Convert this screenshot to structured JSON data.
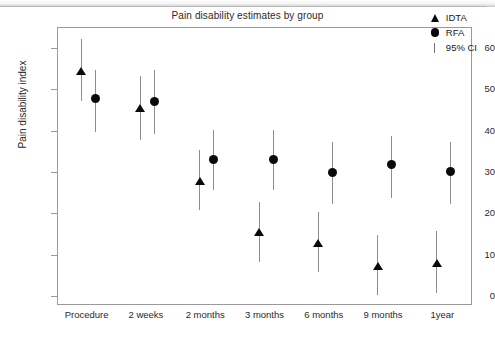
{
  "chart_data": {
    "type": "scatter",
    "title": "Pain disability estimates by group",
    "xlabel": "",
    "ylabel": "Pain disability index",
    "categories": [
      "Procedure",
      "2 weeks",
      "2 months",
      "3 months",
      "6 months",
      "9 months",
      "1year"
    ],
    "ylim": [
      0,
      64
    ],
    "yticks": [
      0,
      10,
      20,
      30,
      40,
      50,
      60
    ],
    "ytick_labels": [
      "0",
      "10",
      "20",
      "30",
      "40",
      "50",
      "60"
    ],
    "grid": false,
    "legend_position": "top-right",
    "legend": [
      {
        "label": "IDTA",
        "marker": "triangle",
        "color": "#0a0a0a"
      },
      {
        "label": "RFA",
        "marker": "circle",
        "color": "#0a0a0a"
      },
      {
        "label": "95% CI",
        "marker": "vertical-bar",
        "color": "#6f6f6f"
      }
    ],
    "series": [
      {
        "name": "IDTA",
        "marker": "triangle",
        "values": [
          54.5,
          45.5,
          28.0,
          15.5,
          13.0,
          7.5,
          8.0
        ],
        "ci_low": [
          47.5,
          38.0,
          21.0,
          8.5,
          6.0,
          0.5,
          1.0
        ],
        "ci_high": [
          62.5,
          53.5,
          35.5,
          23.0,
          20.5,
          15.0,
          16.0
        ]
      },
      {
        "name": "RFA",
        "marker": "circle",
        "values": [
          48.0,
          47.2,
          33.3,
          33.3,
          30.2,
          32.0,
          30.3
        ],
        "ci_low": [
          40.0,
          39.5,
          26.0,
          26.0,
          22.5,
          24.0,
          22.5
        ],
        "ci_high": [
          55.0,
          55.0,
          40.5,
          40.5,
          37.5,
          39.0,
          37.5
        ]
      }
    ]
  },
  "colors": {
    "marker": "#0a0a0a",
    "errorbar": "#8e8e8e",
    "frame": "#9a9a9a",
    "text": "#2a2a2a",
    "background": "#ffffff"
  }
}
